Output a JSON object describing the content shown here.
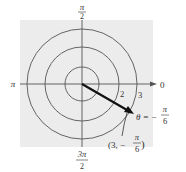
{
  "diagram": {
    "type": "polar-coordinate-plot",
    "background_color": "#ececec",
    "line_color": "#555555",
    "vector_color": "#111111",
    "circles": [
      1,
      2,
      3
    ],
    "ring_labels": [
      "2",
      "3"
    ],
    "axis_labels": {
      "top": {
        "num": "π",
        "den": "2"
      },
      "left": "π",
      "right": "0",
      "bottom": {
        "num": "3π",
        "den": "2"
      }
    },
    "point": {
      "r": 3,
      "theta_label_prefix": "θ = −",
      "theta_num": "π",
      "theta_den": "6",
      "coord_open": "(3, −",
      "coord_num": "π",
      "coord_den": "6",
      "coord_close": ")"
    }
  }
}
